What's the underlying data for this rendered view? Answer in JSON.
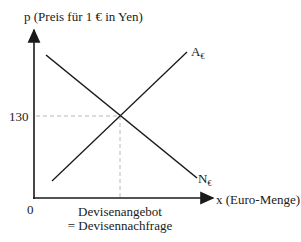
{
  "diagram": {
    "y_axis_label": "p (Preis für 1 € in Yen)",
    "x_axis_label": "x (Euro-Menge)",
    "origin_label": "0",
    "price_tick_label": "130",
    "supply_curve": {
      "letter": "A",
      "subscript": "€"
    },
    "demand_curve": {
      "letter": "N",
      "subscript": "€"
    },
    "equilibrium_label_line1": "Devisenangebot",
    "equilibrium_label_line2": "= Devisennachfrage",
    "colors": {
      "line": "#1a1a1a",
      "guide": "#b8b8b8"
    }
  }
}
